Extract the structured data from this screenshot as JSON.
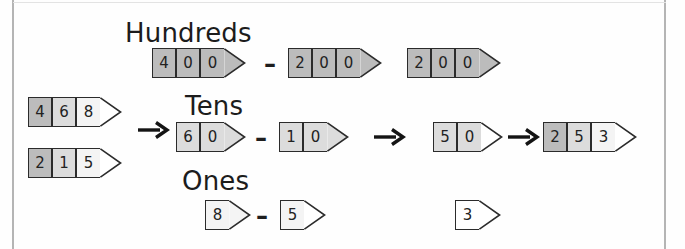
{
  "diagram": {
    "title_row_labels": {
      "hundreds": "Hundreds",
      "tens": "Tens",
      "ones": "Ones"
    },
    "colors": {
      "ink": "#1c1c1c",
      "cell_dark": "#bcbcbc",
      "cell_mid": "#dcdcdc",
      "cell_light": "#f4f4f4",
      "cell_white": "#ffffff",
      "page_edge": "#9a9a9a"
    },
    "operands": {
      "minuend": {
        "digits": [
          "4",
          "6",
          "8"
        ],
        "value": "468"
      },
      "subtrahend": {
        "digits": [
          "2",
          "1",
          "5"
        ],
        "value": "215"
      }
    },
    "hundreds_row": {
      "label": "Hundreds",
      "first": {
        "digits": [
          "4",
          "0",
          "0"
        ],
        "value": "400"
      },
      "operator": "–",
      "second": {
        "digits": [
          "2",
          "0",
          "0"
        ],
        "value": "200"
      },
      "result": {
        "digits": [
          "2",
          "0",
          "0"
        ],
        "value": "200"
      }
    },
    "tens_row": {
      "label": "Tens",
      "first": {
        "digits": [
          "6",
          "0"
        ],
        "value": "60"
      },
      "operator": "–",
      "second": {
        "digits": [
          "1",
          "0"
        ],
        "value": "10"
      },
      "arrow": "right-arrow",
      "result": {
        "digits": [
          "5",
          "0"
        ],
        "value": "50"
      }
    },
    "ones_row": {
      "label": "Ones",
      "first": {
        "digits": [
          "8"
        ],
        "value": "8"
      },
      "operator": "–",
      "second": {
        "digits": [
          "5"
        ],
        "value": "5"
      },
      "result": {
        "digits": [
          "3"
        ],
        "value": "3"
      }
    },
    "final": {
      "digits": [
        "2",
        "5",
        "3"
      ],
      "value": "253"
    },
    "arrows": {
      "split": "right-arrow",
      "tens_to_result": "right-arrow",
      "combine": "right-arrow"
    }
  }
}
